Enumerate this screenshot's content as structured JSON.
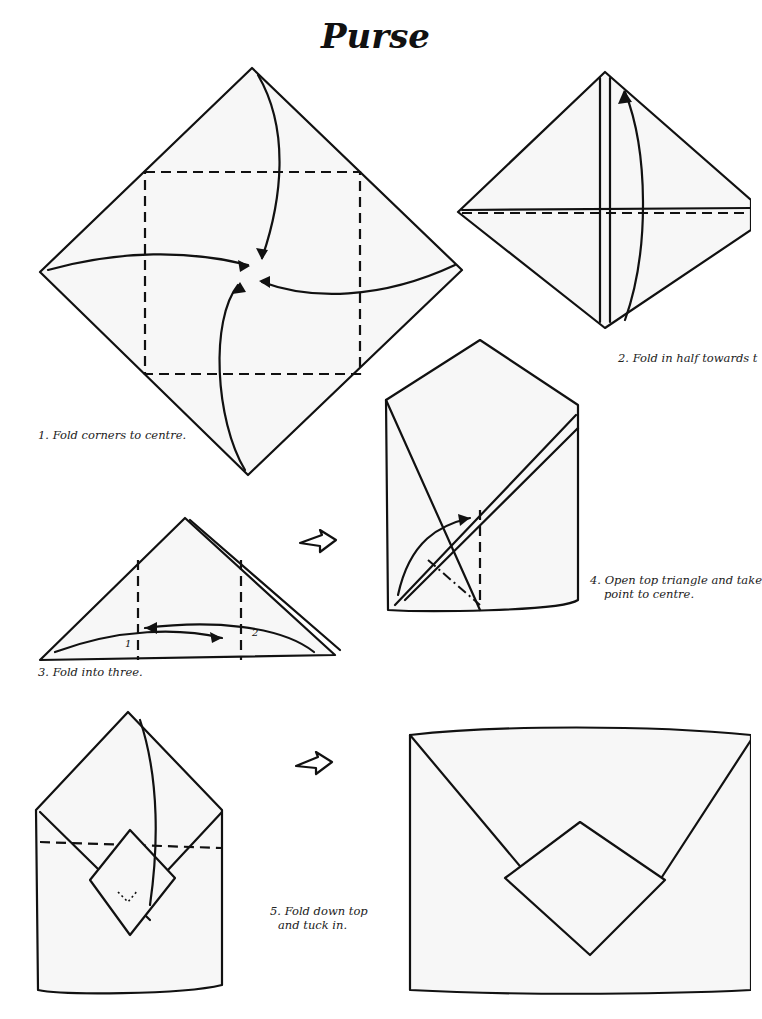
{
  "title": "Purse",
  "steps": [
    {
      "id": 1,
      "caption": "1. Fold corners to centre."
    },
    {
      "id": 2,
      "caption": "2. Fold in half towards t"
    },
    {
      "id": 3,
      "caption": "3. Fold into three.",
      "fold_labels": [
        "1",
        "2"
      ]
    },
    {
      "id": 4,
      "caption_line1": "4. Open top triangle and take",
      "caption_line2": "point to centre."
    },
    {
      "id": 5,
      "caption_line1": "5. Fold down top",
      "caption_line2": "and tuck in."
    }
  ],
  "icons": [
    "open-arrow-icon",
    "open-arrow-icon"
  ]
}
